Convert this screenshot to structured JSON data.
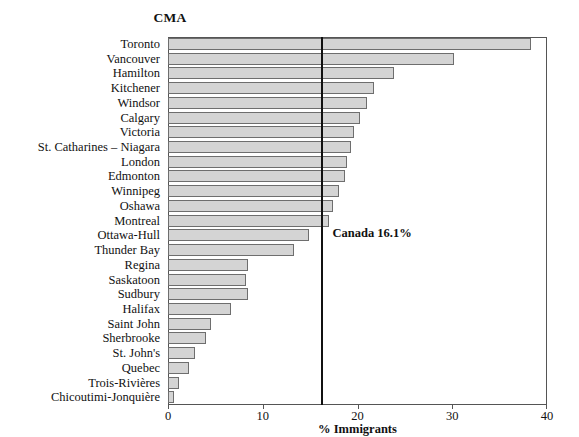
{
  "chart_data": {
    "type": "bar",
    "orientation": "horizontal",
    "title": "CMA",
    "xlabel": "% Immigrants",
    "ylabel": "",
    "xlim": [
      0,
      40
    ],
    "grid": false,
    "legend": null,
    "xticks": [
      0,
      10,
      20,
      30,
      40
    ],
    "xtick_labels": [
      "0",
      "10",
      "20",
      "30",
      "40"
    ],
    "categories": [
      "Toronto",
      "Vancouver",
      "Hamilton",
      "Kitchener",
      "Windsor",
      "Calgary",
      "Victoria",
      "St. Catharines – Niagara",
      "London",
      "Edmonton",
      "Winnipeg",
      "Oshawa",
      "Montreal",
      "Ottawa-Hull",
      "Thunder Bay",
      "Regina",
      "Saskatoon",
      "Sudbury",
      "Halifax",
      "Saint John",
      "Sherbrooke",
      "St. John's",
      "Quebec",
      "Trois-Rivières",
      "Chicoutimi-Jonquière"
    ],
    "values": [
      38.3,
      30.2,
      23.8,
      21.7,
      21.0,
      20.3,
      19.6,
      19.3,
      18.9,
      18.7,
      18.1,
      17.4,
      17.0,
      14.9,
      13.3,
      8.4,
      8.2,
      8.4,
      6.7,
      4.5,
      4.0,
      2.8,
      2.2,
      1.2,
      0.6
    ],
    "annotations": [
      {
        "name": "canada-reference",
        "label": "Canada 16.1%",
        "value": 16.1
      }
    ]
  },
  "colors": {
    "bar_fill": "#d4d4d4",
    "bar_stroke": "#6e6e6e",
    "frame": "#555555",
    "reference_line": "#111111",
    "text": "#111111",
    "background": "#ffffff"
  }
}
